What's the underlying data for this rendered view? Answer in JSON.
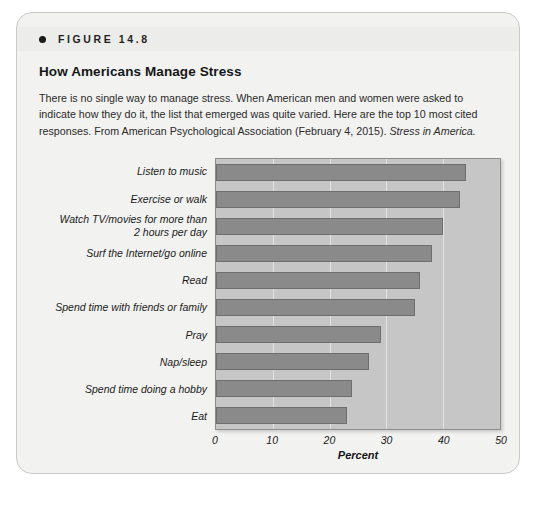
{
  "figure": {
    "number_label": "FIGURE 14.8",
    "title": "How Americans Manage Stress",
    "caption_text": "There is no single way to manage stress. When American men and women were asked to indicate how they do it, the list that emerged was quite varied. Here are the top 10 most cited responses.  From American Psychological Association (February 4, 2015). ",
    "caption_source_italic": "Stress in America."
  },
  "bleed_through_text": "How Americans Manage Stress",
  "colors": {
    "card_background": "#f2f2f0",
    "card_border": "#c9c9c7",
    "header_band": "#ececeb",
    "plot_background": "#c6c6c6",
    "bar_fill": "#8a8a8a",
    "bar_border": "#6e6e6e",
    "gridline": "#e3e3e3",
    "text": "#1b1b1b"
  },
  "chart_data": {
    "type": "bar",
    "orientation": "horizontal",
    "title": "How Americans Manage Stress",
    "xlabel": "Percent",
    "ylabel": "",
    "xlim": [
      0,
      50
    ],
    "xticks": [
      0,
      10,
      20,
      30,
      40,
      50
    ],
    "xtick_labels": [
      "0",
      "10",
      "20",
      "30",
      "40",
      "50"
    ],
    "grid": true,
    "legend": false,
    "categories": [
      "Listen to music",
      "Exercise or walk",
      "Watch TV/movies for more than\n2 hours per day",
      "Surf the Internet/go online",
      "Read",
      "Spend time with friends or family",
      "Pray",
      "Nap/sleep",
      "Spend time doing a hobby",
      "Eat"
    ],
    "values": [
      44,
      43,
      40,
      38,
      36,
      35,
      29,
      27,
      24,
      23
    ]
  }
}
